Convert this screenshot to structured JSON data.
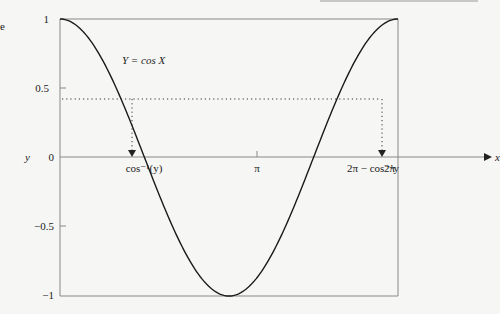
{
  "chart_data": {
    "type": "line",
    "title": "",
    "curve_label": "Y = cos X",
    "xlabel": "x",
    "ylabel": "y",
    "xlim": [
      0,
      6.2832
    ],
    "ylim": [
      -1,
      1
    ],
    "yticks": [
      {
        "value": 1,
        "label": "1"
      },
      {
        "value": 0.5,
        "label": "0.5"
      },
      {
        "value": 0,
        "label": "0"
      },
      {
        "value": -0.5,
        "label": "−0.5"
      },
      {
        "value": -1,
        "label": "−1"
      }
    ],
    "xticks": [
      {
        "value": 3.1416,
        "label": "π"
      },
      {
        "value": 6.2832,
        "label": "2π"
      }
    ],
    "annotations": [
      {
        "label": "cos⁻¹(y)",
        "x": 1.137
      },
      {
        "label": "2π − cos⁻¹y",
        "x": 5.146
      }
    ],
    "reference_level_y": 0.42,
    "series": [
      {
        "name": "cos X",
        "function": "cos(x)",
        "x": [
          0,
          0.785,
          1.571,
          2.356,
          3.1416,
          3.927,
          4.712,
          5.498,
          6.2832
        ],
        "values": [
          1,
          0.707,
          0,
          -0.707,
          -1,
          -0.707,
          0,
          0.707,
          1
        ]
      }
    ],
    "grid": false,
    "legend": "none"
  },
  "labels": {
    "y_axis": "y",
    "x_axis": "x",
    "curve": "Y = cos X",
    "t1": "1",
    "t05": "0.5",
    "t0": "0",
    "tm05": "−0.5",
    "tm1": "−1",
    "pi": "π",
    "twopi": "2π",
    "acos": "cos⁻¹(y)",
    "twopi_minus_acos": "2π − cos⁻¹y",
    "cropped_text": "e"
  }
}
